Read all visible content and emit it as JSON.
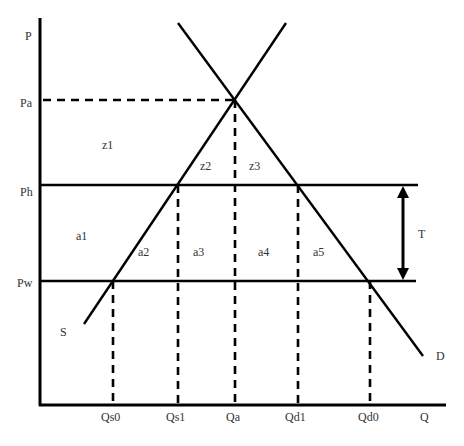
{
  "diagram": {
    "type": "supply-demand-tariff",
    "axes": {
      "y_label": "P",
      "x_label": "Q"
    },
    "price_levels": [
      {
        "id": "Pa",
        "label": "Pa",
        "style": "dashed"
      },
      {
        "id": "Ph",
        "label": "Ph",
        "style": "solid"
      },
      {
        "id": "Pw",
        "label": "Pw",
        "style": "solid"
      }
    ],
    "quantity_levels": [
      {
        "id": "Qs0",
        "label": "Qs0"
      },
      {
        "id": "Qs1",
        "label": "Qs1"
      },
      {
        "id": "Qa",
        "label": "Qa"
      },
      {
        "id": "Qd1",
        "label": "Qd1"
      },
      {
        "id": "Qd0",
        "label": "Qd0"
      }
    ],
    "curves": [
      {
        "id": "S",
        "label": "S",
        "kind": "supply"
      },
      {
        "id": "D",
        "label": "D",
        "kind": "demand"
      }
    ],
    "areas": [
      "z1",
      "z2",
      "z3",
      "a1",
      "a2",
      "a3",
      "a4",
      "a5"
    ],
    "tariff": {
      "label": "T",
      "from": "Pw",
      "to": "Ph"
    },
    "color": "#000000"
  }
}
